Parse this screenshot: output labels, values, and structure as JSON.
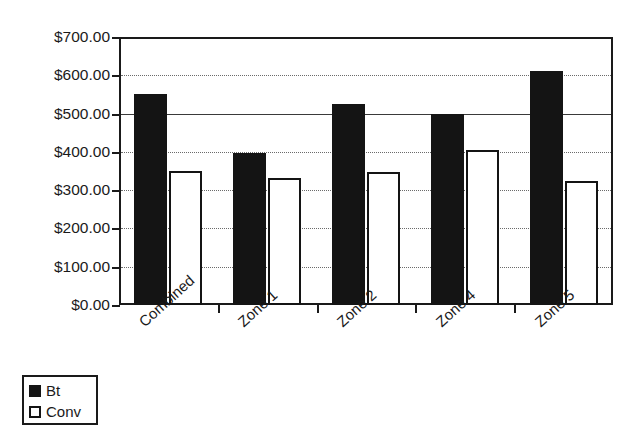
{
  "chart_data": {
    "type": "bar",
    "title": "",
    "xlabel": "",
    "ylabel": "",
    "categories": [
      "Combined",
      "Zone 1",
      "Zone 2",
      "Zone 4",
      "Zone 5"
    ],
    "series": [
      {
        "name": "Bt",
        "color": "#141414",
        "fill": "solid",
        "values": [
          550,
          398,
          525,
          500,
          610
        ]
      },
      {
        "name": "Conv",
        "color": "#ffffff",
        "fill": "hollow",
        "values": [
          350,
          331,
          348,
          405,
          324
        ]
      }
    ],
    "ylim": [
      0,
      700
    ],
    "ytick_step": 100,
    "ytick_labels": [
      "$700.00",
      "$600.00",
      "$500.00",
      "$400.00",
      "$300.00",
      "$200.00",
      "$100.00",
      "$0.00"
    ],
    "ytick_values": [
      700,
      600,
      500,
      400,
      300,
      200,
      100,
      0
    ],
    "grid": true,
    "grid_axis": "y",
    "legend": {
      "position": "bottom-left",
      "entries": [
        {
          "label": "Bt",
          "swatch": "filled-black-square"
        },
        {
          "label": "Conv",
          "swatch": "hollow-square"
        }
      ]
    },
    "category_label_rotation_deg": -42,
    "value_prefix": "$"
  }
}
